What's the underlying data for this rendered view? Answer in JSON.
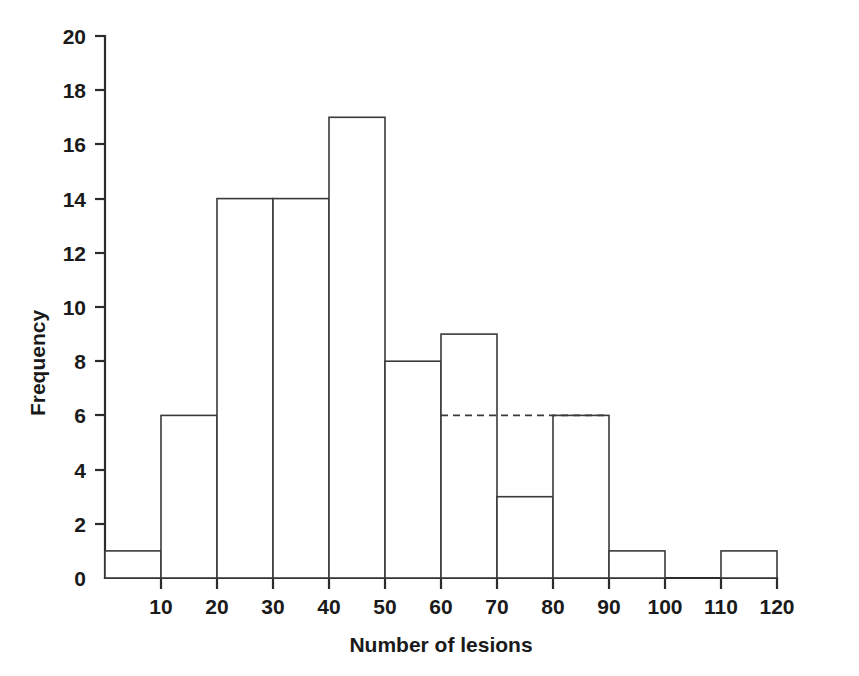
{
  "figure": {
    "background_color": "#ffffff",
    "ink_color": "#1a1a1a",
    "line_color": "#3a3a3a"
  },
  "chart_data": {
    "type": "bar",
    "subtype": "histogram",
    "title": "",
    "subtitle": "",
    "xlabel": "Number of lesions",
    "ylabel": "Frequency",
    "xlim": [
      0,
      120
    ],
    "ylim": [
      0,
      20
    ],
    "x_ticks": [
      10,
      20,
      30,
      40,
      50,
      60,
      70,
      80,
      90,
      100,
      110,
      120
    ],
    "x_tick_labels": [
      "10",
      "20",
      "30",
      "40",
      "50",
      "60",
      "70",
      "80",
      "90",
      "100",
      "110",
      "120"
    ],
    "y_ticks": [
      0,
      2,
      4,
      6,
      8,
      10,
      12,
      14,
      16,
      18,
      20
    ],
    "y_tick_labels": [
      "0",
      "2",
      "4",
      "6",
      "8",
      "10",
      "12",
      "14",
      "16",
      "18",
      "20"
    ],
    "grid": false,
    "legend": null,
    "legend_position": "none",
    "bin_width": 10,
    "bin_edges": [
      0,
      10,
      20,
      30,
      40,
      50,
      60,
      70,
      80,
      90,
      100,
      110,
      120
    ],
    "categories": [
      "0-10",
      "10-20",
      "20-30",
      "30-40",
      "40-50",
      "50-60",
      "60-70",
      "70-80",
      "80-90",
      "90-100",
      "100-110",
      "110-120"
    ],
    "values": [
      1,
      6,
      14,
      14,
      17,
      8,
      9,
      3,
      6,
      1,
      0,
      1
    ],
    "bars": [
      {
        "label": "0-10",
        "x0": 0,
        "x1": 10,
        "value": 1
      },
      {
        "label": "10-20",
        "x0": 10,
        "x1": 20,
        "value": 6
      },
      {
        "label": "20-30",
        "x0": 20,
        "x1": 30,
        "value": 14
      },
      {
        "label": "30-40",
        "x0": 30,
        "x1": 40,
        "value": 14
      },
      {
        "label": "40-50",
        "x0": 40,
        "x1": 50,
        "value": 17
      },
      {
        "label": "50-60",
        "x0": 50,
        "x1": 60,
        "value": 8
      },
      {
        "label": "60-70",
        "x0": 60,
        "x1": 70,
        "value": 9
      },
      {
        "label": "70-80",
        "x0": 70,
        "x1": 80,
        "value": 3
      },
      {
        "label": "80-90",
        "x0": 80,
        "x1": 90,
        "value": 6
      },
      {
        "label": "90-100",
        "x0": 90,
        "x1": 100,
        "value": 1
      },
      {
        "label": "100-110",
        "x0": 100,
        "x1": 110,
        "value": 0
      },
      {
        "label": "110-120",
        "x0": 110,
        "x1": 120,
        "value": 1
      }
    ],
    "annotations": [
      {
        "type": "dashed-horizontal-line",
        "name": "level-6-reference-line",
        "y": 6,
        "x_start": 60,
        "x_end": 90,
        "style": "dashed"
      }
    ],
    "total_frequency": 80
  }
}
